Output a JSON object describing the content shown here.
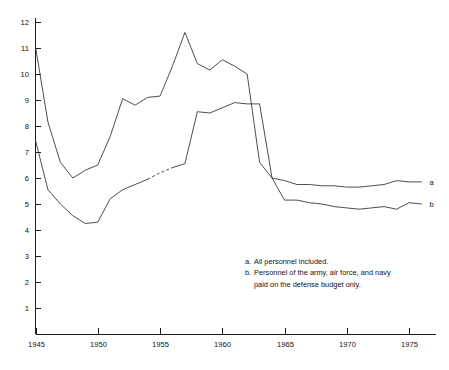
{
  "chart_data": {
    "type": "line",
    "title": "",
    "xlabel": "",
    "ylabel": "",
    "xlim": [
      1945,
      1976
    ],
    "ylim": [
      0,
      12.4
    ],
    "grid": false,
    "legend_position": "line-end-labels",
    "x_ticks": [
      "1945",
      "1950",
      "1955",
      "1960",
      "1965",
      "1970",
      "1975"
    ],
    "x_tick_values": [
      1945,
      1950,
      1955,
      1960,
      1965,
      1970,
      1975
    ],
    "y_ticks": [
      "1",
      "2",
      "3",
      "4",
      "5",
      "6",
      "7",
      "8",
      "9",
      "10",
      "11",
      "12"
    ],
    "y_tick_values": [
      1,
      2,
      3,
      4,
      5,
      6,
      7,
      8,
      9,
      10,
      11,
      12
    ],
    "x": [
      1945,
      1946,
      1947,
      1948,
      1949,
      1950,
      1951,
      1952,
      1953,
      1954,
      1955,
      1956,
      1957,
      1958,
      1959,
      1960,
      1961,
      1962,
      1963,
      1964,
      1965,
      1966,
      1967,
      1968,
      1969,
      1970,
      1971,
      1972,
      1973,
      1974,
      1975,
      1976
    ],
    "series": [
      {
        "name": "a",
        "end_label": "a",
        "note": "All personnel included.",
        "style": "solid",
        "values": [
          11.05,
          8.15,
          6.6,
          6.0,
          6.3,
          6.5,
          7.6,
          9.05,
          8.8,
          9.1,
          9.15,
          10.3,
          11.6,
          10.4,
          10.15,
          10.55,
          10.3,
          10.0,
          6.6,
          6.0,
          5.9,
          5.75,
          5.75,
          5.7,
          5.7,
          5.65,
          5.65,
          5.7,
          5.75,
          5.9,
          5.85,
          5.85
        ]
      },
      {
        "name": "b",
        "end_label": "b",
        "note": "Personnel of the army, air force, and navy paid on the defense budget only.",
        "style": "solid-with-dashed-gap",
        "dashed_segment_years": [
          1954,
          1956
        ],
        "values": [
          7.45,
          5.55,
          5.0,
          4.55,
          4.25,
          4.3,
          5.2,
          5.55,
          5.75,
          5.95,
          6.2,
          6.4,
          6.55,
          8.55,
          8.5,
          8.7,
          8.9,
          8.85,
          8.85,
          6.0,
          5.15,
          5.15,
          5.05,
          5.0,
          4.9,
          4.85,
          4.8,
          4.85,
          4.9,
          4.8,
          5.05,
          5.0
        ]
      }
    ],
    "footnotes": [
      {
        "marker": "a.",
        "line1": "All personnel included.",
        "line2": ""
      },
      {
        "marker": "b.",
        "line1": "Personnel of the army, air force, and navy",
        "line2": "paid on the defense budget only."
      }
    ]
  },
  "colors": {
    "background": "#ffffff",
    "axis": "#1a1a1a",
    "line": "#3a3a3a",
    "text": "#111111"
  }
}
